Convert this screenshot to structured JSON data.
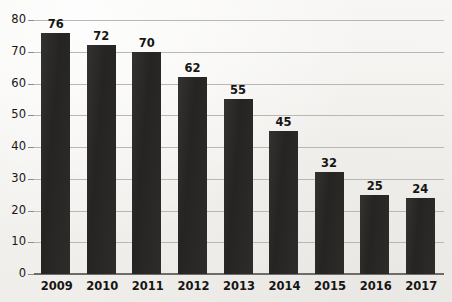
{
  "chart_data": {
    "type": "bar",
    "title": "",
    "subtitle": "",
    "xlabel": "",
    "ylabel": "",
    "categories": [
      "2009",
      "2010",
      "2011",
      "2012",
      "2013",
      "2014",
      "2015",
      "2016",
      "2017"
    ],
    "values": [
      76,
      72,
      70,
      62,
      55,
      45,
      32,
      25,
      24
    ],
    "data_labels": [
      "76",
      "72",
      "70",
      "62",
      "55",
      "45",
      "32",
      "25",
      "24"
    ],
    "ylim": [
      0,
      80
    ],
    "ytick_values": [
      0,
      10,
      20,
      30,
      40,
      50,
      60,
      70,
      80
    ],
    "ytick_labels": [
      "0",
      "10",
      "20",
      "30",
      "40",
      "50",
      "60",
      "70",
      "80"
    ],
    "ytick_step": 10,
    "grid": true,
    "grid_axis": "y",
    "legend": false,
    "legend_position": "none",
    "annotations": [],
    "series": [
      {
        "name": "",
        "values": [
          76,
          72,
          70,
          62,
          55,
          45,
          32,
          25,
          24
        ]
      }
    ]
  },
  "style": {
    "bar_color": "#2b2927",
    "grid_color": "#b9b7b3",
    "axis_color": "#6e6c69",
    "text_color": "#171513",
    "background_color": "#f5f4f2"
  }
}
